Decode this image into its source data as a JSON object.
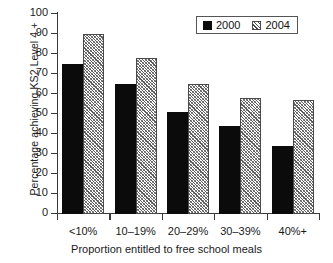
{
  "chart_data": {
    "type": "bar",
    "title": "",
    "xlabel": "Proportion entitled to free school meals",
    "ylabel": "Percentage achieving KS2 Level 4 +",
    "categories": [
      "<10%",
      "10–19%",
      "20–29%",
      "30–39%",
      "40%+"
    ],
    "series": [
      {
        "name": "2000",
        "values": [
          75,
          65,
          51,
          44,
          34
        ],
        "color": "#0b0b0b",
        "fill": "solid-black"
      },
      {
        "name": "2004",
        "values": [
          90,
          78,
          65,
          58,
          57
        ],
        "color": "#8d8d8d",
        "fill": "diagonal-hatch"
      }
    ],
    "ylim": [
      0,
      100
    ],
    "yticks": [
      0,
      10,
      20,
      30,
      40,
      50,
      60,
      70,
      80,
      90,
      100
    ],
    "ytick_labels": [
      "0",
      "10",
      "20",
      "30",
      "40",
      "50",
      "60",
      "70",
      "80",
      "90",
      "100"
    ],
    "grid": false,
    "legend_position": "top-right",
    "legend_entries": [
      "2000",
      "2004"
    ]
  }
}
